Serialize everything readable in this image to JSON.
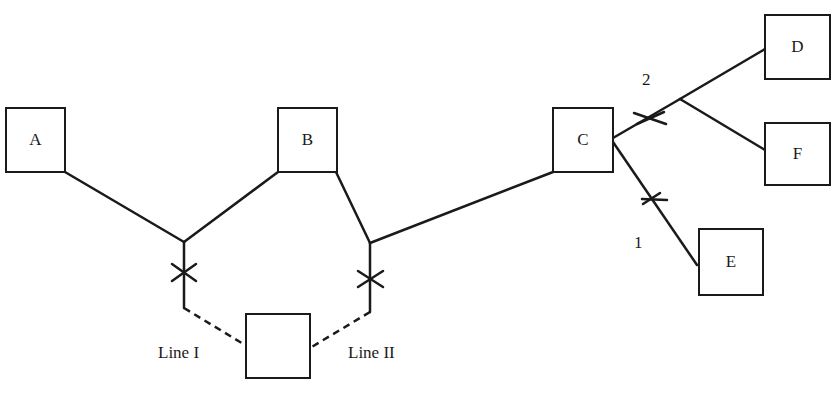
{
  "diagram": {
    "nodes": {
      "A": {
        "label": "A"
      },
      "B": {
        "label": "B"
      },
      "C": {
        "label": "C"
      },
      "D": {
        "label": "D"
      },
      "E": {
        "label": "E"
      },
      "F": {
        "label": "F"
      },
      "center": {
        "label": ""
      }
    },
    "labels": {
      "line1": "Line I",
      "line2": "Line II",
      "branch1": "1",
      "branch2": "2"
    },
    "colors": {
      "stroke": "#1a1a1a",
      "background": "#ffffff"
    }
  }
}
